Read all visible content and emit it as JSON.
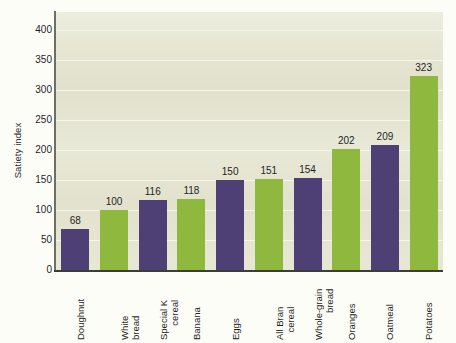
{
  "chart_data": {
    "type": "bar",
    "title": "",
    "xlabel": "",
    "ylabel": "Satiety index",
    "ylim": [
      0,
      430
    ],
    "ytick_step": 50,
    "yticks": [
      0,
      50,
      100,
      150,
      200,
      250,
      300,
      350,
      400
    ],
    "ytick_labels": [
      "0",
      "50",
      "100",
      "150",
      "200",
      "250",
      "300",
      "350",
      "400"
    ],
    "grid": true,
    "grid_axis": "y",
    "legend": false,
    "show_value_labels": true,
    "categories": [
      "Doughnut",
      "White bread",
      "Special K cereal",
      "Banana",
      "Eggs",
      "All Bran cereal",
      "Whole-grain bread",
      "Oranges",
      "Oatmeal",
      "Potatoes"
    ],
    "category_lines": [
      [
        "Doughnut"
      ],
      [
        "White",
        "bread"
      ],
      [
        "Special K",
        "cereal"
      ],
      [
        "Banana"
      ],
      [
        "Eggs"
      ],
      [
        "All Bran",
        "cereal"
      ],
      [
        "Whole-grain",
        "bread"
      ],
      [
        "Oranges"
      ],
      [
        "Oatmeal"
      ],
      [
        "Potatoes"
      ]
    ],
    "values": [
      68,
      100,
      116,
      118,
      150,
      151,
      154,
      202,
      209,
      323
    ],
    "value_labels": [
      "68",
      "100",
      "116",
      "118",
      "150",
      "151",
      "154",
      "202",
      "209",
      "323"
    ],
    "bar_colors": [
      "#4E3F75",
      "#8FB93E",
      "#4E3F75",
      "#8FB93E",
      "#4E3F75",
      "#8FB93E",
      "#4E3F75",
      "#8FB93E",
      "#4E3F75",
      "#8FB93E"
    ]
  },
  "palette": {
    "purple": "#4E3F75",
    "green": "#8FB93E",
    "plot_background": "#e6e6d2",
    "gridline": "#f6f6ec",
    "axis": "#3d3d38",
    "figure_background": "#fdfdf8",
    "text": "#1f1f1f"
  }
}
